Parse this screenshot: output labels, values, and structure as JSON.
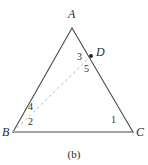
{
  "figure": {
    "caption": "(b)",
    "caption_x": 0,
    "caption_y": 149,
    "width": 148,
    "height": 165,
    "background": "#ffffff",
    "stroke_color": "#4a4a4a",
    "dash_color": "#b9b9b9",
    "text_color": "#2b2b2b",
    "point_color": "#1a1a1a"
  },
  "vertices": [
    {
      "name": "A",
      "label": "A",
      "x": 72,
      "y": 28,
      "label_x": 68,
      "label_y": 8
    },
    {
      "name": "B",
      "label": "B",
      "x": 13,
      "y": 132,
      "label_x": 2,
      "label_y": 127
    },
    {
      "name": "C",
      "label": "C",
      "x": 133,
      "y": 132,
      "label_x": 136,
      "label_y": 127
    },
    {
      "name": "D",
      "label": "D",
      "x": 91,
      "y": 56,
      "label_x": 96,
      "label_y": 46
    }
  ],
  "segments": [
    {
      "name": "side-AB",
      "from": "A",
      "to": "B",
      "style": "solid"
    },
    {
      "name": "side-AC",
      "from": "A",
      "to": "C",
      "style": "solid"
    },
    {
      "name": "side-BC",
      "from": "B",
      "to": "C",
      "style": "solid"
    },
    {
      "name": "cevian-BD",
      "from": "B",
      "to": "D",
      "style": "dashed"
    }
  ],
  "angle_labels": [
    {
      "name": "angle-1",
      "label": "1",
      "x": 111,
      "y": 116,
      "at_vertex": "C"
    },
    {
      "name": "angle-2",
      "label": "2",
      "x": 28,
      "y": 118,
      "at_vertex": "B"
    },
    {
      "name": "angle-3",
      "label": "3",
      "x": 77,
      "y": 52,
      "at_vertex": "D"
    },
    {
      "name": "angle-4",
      "label": "4",
      "x": 28,
      "y": 103,
      "at_vertex": "B"
    },
    {
      "name": "angle-5",
      "label": "5",
      "x": 84,
      "y": 64,
      "at_vertex": "D"
    }
  ]
}
